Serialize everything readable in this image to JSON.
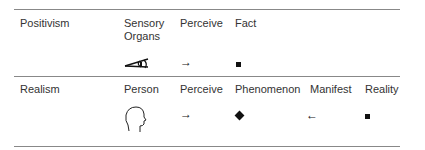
{
  "rows": [
    {
      "label": "Positivism",
      "columns": [
        {
          "text": "Sensory Organs",
          "symbol": "eye-icon"
        },
        {
          "text": "Perceive",
          "symbol": "arrow-right"
        },
        {
          "text": "Fact",
          "symbol": "square"
        }
      ]
    },
    {
      "label": "Realism",
      "columns": [
        {
          "text": "Person",
          "symbol": "head-profile-icon"
        },
        {
          "text": "Perceive",
          "symbol": "arrow-right"
        },
        {
          "text": "Phenomenon",
          "symbol": "diamond"
        },
        {
          "text": "Manifest",
          "symbol": "arrow-left"
        },
        {
          "text": "Reality",
          "symbol": "square"
        }
      ]
    }
  ],
  "symbols": {
    "arrow_right": "→",
    "arrow_left": "←"
  }
}
